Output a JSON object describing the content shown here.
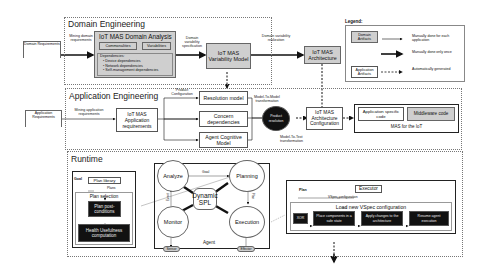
{
  "inputs": {
    "domain_requirements": "Domain Requirements",
    "application_requirements": "Application Requirements"
  },
  "domain_engineering": {
    "title": "Domain Engineering",
    "mining_label": "Mining domain requirements",
    "analysis_title": "IoT MAS Domain Analysis",
    "commonalities": "Commonalities",
    "variabilities": "Variabilities",
    "dependencies_title": "Dependencies:",
    "dependencies": [
      "• Device dependencies",
      "• Network dependencies",
      "• Self-management dependencies"
    ],
    "spec_label": "Domain variability specification",
    "variability_model": "IoT MAS Variability Model",
    "realization_label": "Domain variability realization",
    "architecture": "IoT MAS Architecture"
  },
  "legend": {
    "title": "Legend:",
    "domain_artifacts": "Domain Artifacts",
    "application_artifacts": "Application Artifacts",
    "items": [
      {
        "style": "thin",
        "label": "Manually done for each application"
      },
      {
        "style": "thick",
        "label": "Manually done only once"
      },
      {
        "style": "dashed",
        "label": "Automatically generated"
      }
    ]
  },
  "application_engineering": {
    "title": "Application Engineering",
    "mining_label": "Mining application requirements",
    "app_requirements": "IoT MAS Application requirements",
    "product_config_label": "Product Configuration",
    "resolution_model": "Resolution model",
    "concern_dependencies": "Concern dependencies",
    "agent_cognitive_model": "Agent Cognitive Model",
    "m2m_label": "Model-To-Model transformation",
    "product_resolution": "Product resolution",
    "m2t_label": "Model-To-Text transformation",
    "architecture_config": "IoT MAS Architecture Configuration",
    "app_code": "Application specific code",
    "middleware_code": "Middleware code",
    "mas_label": "MAS for the IoT"
  },
  "runtime": {
    "title": "Runtime",
    "planning_panel": {
      "goal": "Goal",
      "plan_library": "Plan library",
      "plans": "Plans",
      "plan_selection": "Plan selection",
      "post_conditions": "Plan post-conditions",
      "health": "Health Usefulness computation"
    },
    "agent": {
      "label": "Agent",
      "analyze": "Analyze",
      "planning": "Planning",
      "monitor": "Monitor",
      "execution": "Execution",
      "center": "Dynamic SPL",
      "goal_label": "Goal",
      "event_label": "Event",
      "plan_label": "Plan",
      "sensor": "Sensor",
      "effector": "Effector"
    },
    "execution_panel": {
      "plan": "Plan",
      "executor": "Executor",
      "vspec_label": "VSpec configuration",
      "load_title": "Load new VSpec configuration",
      "steps": [
        "XOR",
        "Place components in a safe state",
        "Apply changes to the architecture",
        "Resume agent execution"
      ]
    }
  },
  "colors": {
    "domain_fill": "#cfcfcf",
    "black_node": "#111111",
    "border": "#555555"
  }
}
